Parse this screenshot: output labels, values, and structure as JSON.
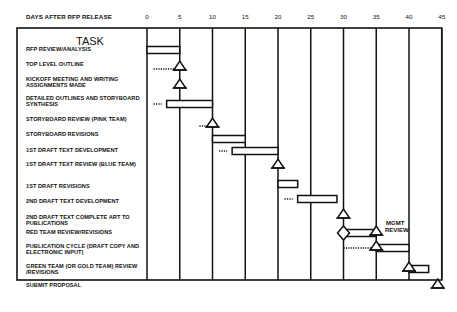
{
  "chart_data": {
    "type": "gantt",
    "title": "",
    "header_label": "DAYS AFTER RFP RELEASE",
    "task_column_title": "TASK",
    "xlabel": "DAYS AFTER RFP RELEASE",
    "x_ticks": [
      0,
      5,
      10,
      15,
      20,
      25,
      30,
      35,
      40,
      45
    ],
    "xlim": [
      0,
      45
    ],
    "grid": true,
    "tasks": [
      {
        "label": "RFP REVIEW/ANALYSIS",
        "kind": "bar",
        "start": 0,
        "end": 5
      },
      {
        "label": "TOP LEVEL OUTLINE",
        "kind": "milestone",
        "at": 5,
        "lead_from": 1
      },
      {
        "label": "KICKOFF MEETING AND WRITING ASSIGNMENTS MADE",
        "kind": "milestone",
        "at": 5
      },
      {
        "label": "DETAILED OUTLINES AND STORYBOARD SYNTHESIS",
        "kind": "bar",
        "start": 3,
        "end": 10,
        "lead_from": 1
      },
      {
        "label": "STORYBOARD REVIEW (PINK TEAM)",
        "kind": "milestone",
        "at": 10,
        "lead_from": 8
      },
      {
        "label": "STORYBOARD REVISIONS",
        "kind": "bar",
        "start": 10,
        "end": 15
      },
      {
        "label": "1ST DRAFT TEXT DEVELOPMENT",
        "kind": "bar",
        "start": 13,
        "end": 20,
        "lead_from": 11
      },
      {
        "label": "1ST DRAFT TEXT REVIEW (BLUE TEAM)",
        "kind": "milestone",
        "at": 20
      },
      {
        "label": "1ST DRAFT REVISIONS",
        "kind": "bar",
        "start": 20,
        "end": 23
      },
      {
        "label": "2ND DRAFT TEXT DEVELOPMENT",
        "kind": "bar",
        "start": 23,
        "end": 29,
        "lead_from": 21
      },
      {
        "label": "2ND DRAFT TEXT COMPLETE ART TO PUBLICATIONS",
        "kind": "milestone",
        "at": 30
      },
      {
        "label": "RED TEAM REVIEW/REVISIONS",
        "kind": "bar",
        "start": 30,
        "end": 35,
        "start_marker": "diamond",
        "end_marker": "triangle",
        "annotation": "MGMT REVIEW"
      },
      {
        "label": "PUBLICATION CYCLE (DRAFT COPY AND ELECTRONIC INPUT)",
        "kind": "bar",
        "start": 35,
        "end": 40,
        "start_marker": "triangle",
        "lead_from": 30
      },
      {
        "label": "GREEN TEAM (OR GOLD TEAM) REVIEW /REVISIONS",
        "kind": "bar",
        "start": 40,
        "end": 43,
        "start_marker": "triangle"
      },
      {
        "label": "SUBMIT PROPOSAL",
        "kind": "milestone",
        "at": 45
      }
    ]
  },
  "annotations": {
    "mgmt_review_line1": "MGMT",
    "mgmt_review_line2": "REVIEW"
  }
}
